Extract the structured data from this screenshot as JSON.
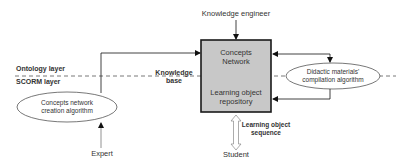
{
  "diagram": {
    "actors": {
      "knowledge_engineer": "Knowledge engineer",
      "expert": "Expert",
      "student": "Student"
    },
    "layers": {
      "ontology": "Ontology layer",
      "scorm": "SCORM layer"
    },
    "knowledge_base_label_line1": "Knowledge",
    "knowledge_base_label_line2": "base",
    "central_box": {
      "top_line1": "Concepts",
      "top_line2": "Network",
      "bottom_line1": "Learning object",
      "bottom_line2": "repository",
      "fill": "#c8c8c8",
      "border": "#1a1a1a"
    },
    "left_process": {
      "line1": "Concepts network",
      "line2": "creation algorithm"
    },
    "right_process": {
      "line1": "Didactic materials'",
      "line2": "compilation algorithm"
    },
    "sequence_label_line1": "Learning object",
    "sequence_label_line2": "sequence"
  }
}
